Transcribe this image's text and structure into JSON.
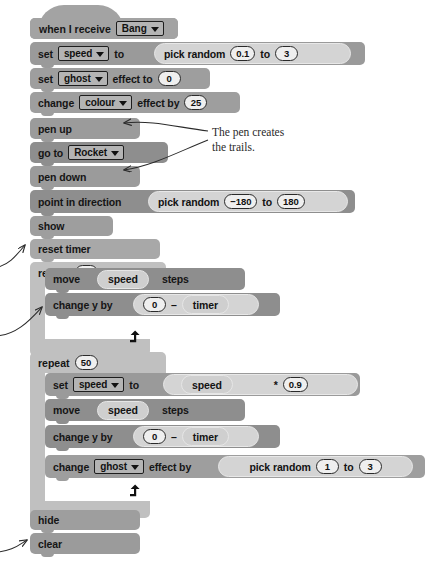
{
  "script": {
    "title": "Scratch script - Rocket trails",
    "blocks": [
      {
        "id": "hat",
        "kind": "hat",
        "text": "when I receive",
        "dropdown": "Bang"
      },
      {
        "id": "set-speed",
        "kind": "stack",
        "text": "set",
        "dropdown": "speed",
        "text2": "to",
        "operator": {
          "label": "pick random",
          "a": "0.1",
          "mid": "to",
          "b": "3"
        }
      },
      {
        "id": "set-ghost",
        "kind": "stack",
        "text": "set",
        "dropdown": "ghost",
        "text2": "effect to",
        "value": "0"
      },
      {
        "id": "chg-colour",
        "kind": "stack",
        "text": "change",
        "dropdown": "colour",
        "text2": "effect by",
        "value": "25"
      },
      {
        "id": "pen-up",
        "kind": "stack",
        "text": "pen up"
      },
      {
        "id": "go-to",
        "kind": "stack",
        "text": "go to",
        "dropdown": "Rocket"
      },
      {
        "id": "pen-down",
        "kind": "stack",
        "text": "pen down"
      },
      {
        "id": "point-dir",
        "kind": "stack",
        "text": "point in direction",
        "operator": {
          "label": "pick random",
          "a": "−180",
          "mid": "to",
          "b": "180"
        }
      },
      {
        "id": "show",
        "kind": "stack",
        "text": "show"
      },
      {
        "id": "reset-timer",
        "kind": "stack",
        "text": "reset timer"
      },
      {
        "id": "repeat-1",
        "kind": "c",
        "text": "repeat",
        "value": "50"
      },
      {
        "id": "move-1",
        "kind": "stack",
        "text": "move",
        "var": "speed",
        "text2": "steps"
      },
      {
        "id": "chg-y-1",
        "kind": "stack",
        "text": "change y by",
        "operator": {
          "a": "0",
          "sign": "–",
          "var": "timer"
        }
      },
      {
        "id": "repeat-2",
        "kind": "c",
        "text": "repeat",
        "value": "50"
      },
      {
        "id": "set-speed-2",
        "kind": "stack",
        "text": "set",
        "dropdown": "speed",
        "text2": "to",
        "operator": {
          "var": "speed",
          "sign": "*",
          "b": "0.9"
        }
      },
      {
        "id": "move-2",
        "kind": "stack",
        "text": "move",
        "var": "speed",
        "text2": "steps"
      },
      {
        "id": "chg-y-2",
        "kind": "stack",
        "text": "change y by",
        "operator": {
          "a": "0",
          "sign": "–",
          "var": "timer"
        }
      },
      {
        "id": "chg-ghost",
        "kind": "stack",
        "text": "change",
        "dropdown": "ghost",
        "text2": "effect by",
        "operator": {
          "label": "pick random",
          "a": "1",
          "mid": "to",
          "b": "3"
        }
      },
      {
        "id": "hide",
        "kind": "stack",
        "text": "hide"
      },
      {
        "id": "clear",
        "kind": "stack",
        "text": "clear"
      }
    ]
  },
  "annotation": {
    "pen_note": "The pen creates\nthe trails."
  },
  "colors": {
    "event": "#a3a3a3",
    "data": "#9a9a9a",
    "looks": "#9e9e9e",
    "pen": "#9b9b9b",
    "motion": "#8e8e8e",
    "sensing": "#a8a8a8",
    "control": "#c0c0c0",
    "control_inner": "#c6c6c6",
    "page_background": "#ffffff",
    "annotation_text": "#2a2a2a"
  }
}
